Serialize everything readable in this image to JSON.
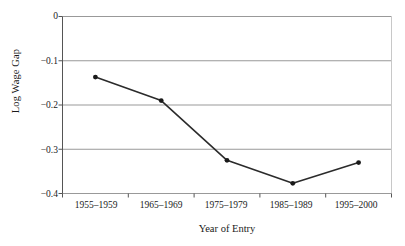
{
  "chart_data": {
    "type": "line",
    "title": "",
    "xlabel": "Year of Entry",
    "ylabel": "Log Wage Gap",
    "categories": [
      "1955–1959",
      "1965–1969",
      "1975–1979",
      "1985–1989",
      "1995–2000"
    ],
    "values": [
      -0.137,
      -0.19,
      -0.325,
      -0.377,
      -0.33
    ],
    "series": [
      {
        "name": "Log Wage Gap",
        "values": [
          -0.137,
          -0.19,
          -0.325,
          -0.377,
          -0.33
        ]
      }
    ],
    "ylim": [
      -0.4,
      0
    ],
    "yticks": [
      0,
      -0.1,
      -0.2,
      -0.3,
      -0.4
    ],
    "ytick_labels": [
      "0",
      "−0.1",
      "−0.2",
      "−0.3",
      "−0.4"
    ],
    "grid": "horizontal",
    "legend": "none",
    "marker": "filled-circle",
    "line_color": "#2b2b2b",
    "marker_color": "#1a1a1a",
    "grid_color": "#999999",
    "axis_color": "#555555",
    "background": "#ffffff"
  },
  "axis": {
    "x_title": "Year of Entry",
    "y_title": "Log Wage Gap"
  }
}
